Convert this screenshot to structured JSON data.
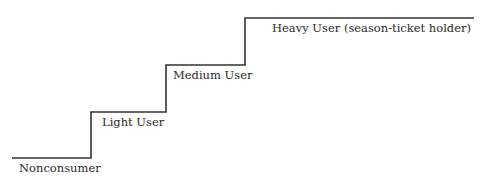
{
  "diagram": {
    "type": "staircase",
    "line_color": "#333333",
    "steps": [
      {
        "label": "Nonconsumer",
        "level": 1
      },
      {
        "label": "Light User",
        "level": 2
      },
      {
        "label": "Medium User",
        "level": 3
      },
      {
        "label": "Heavy User (season-ticket holder)",
        "level": 4
      }
    ]
  }
}
